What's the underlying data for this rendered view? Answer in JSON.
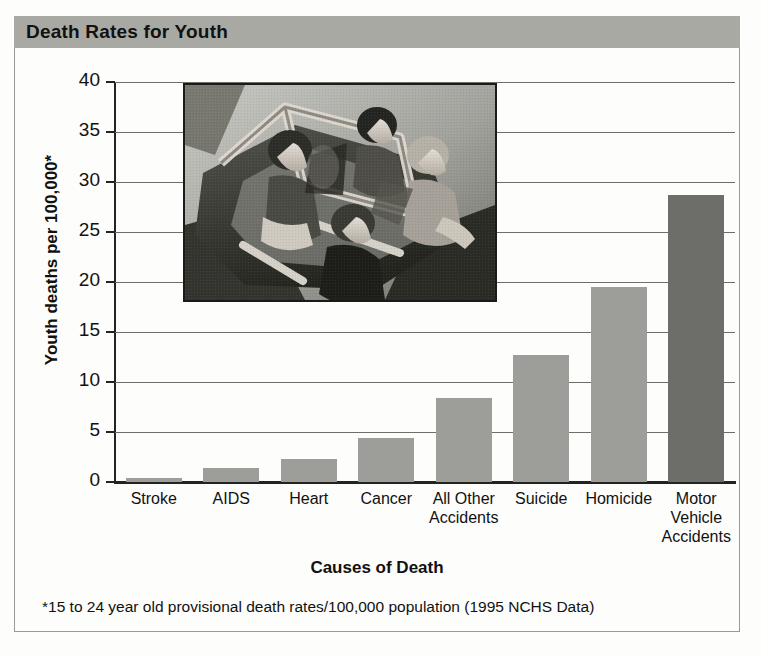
{
  "title": "Death Rates for Youth",
  "footnote": "*15 to 24 year old provisional death rates/100,000 population (1995 NCHS Data)",
  "colors": {
    "title_band": "#a9a9a4",
    "bar_default": "#9d9d99",
    "bar_highlight": "#6d6d69",
    "axis": "#23231f",
    "gridline": "#6f6f6a",
    "background": "#fdfdfb"
  },
  "photo": {
    "alt": "Black and white overhead photograph of four young people riding in an open convertible car",
    "name": "teens-in-convertible-photo"
  },
  "chart_data": {
    "type": "bar",
    "title": "Death Rates for Youth",
    "xlabel": "Causes of Death",
    "ylabel": "Youth deaths per 100,000*",
    "ylim": [
      0,
      40
    ],
    "yticks": [
      0,
      5,
      10,
      15,
      20,
      25,
      30,
      35,
      40
    ],
    "ytick_labels": [
      "0",
      "5",
      "10",
      "15",
      "20",
      "25",
      "30",
      "35",
      "40"
    ],
    "grid": true,
    "legend": "none",
    "categories": [
      "Stroke",
      "AIDS",
      "Heart",
      "Cancer",
      "All Other Accidents",
      "Suicide",
      "Homicide",
      "Motor Vehicle Accidents"
    ],
    "category_lines": [
      [
        "Stroke"
      ],
      [
        "AIDS"
      ],
      [
        "Heart"
      ],
      [
        "Cancer"
      ],
      [
        "All Other",
        "Accidents"
      ],
      [
        "Suicide"
      ],
      [
        "Homicide"
      ],
      [
        "Motor",
        "Vehicle",
        "Accidents"
      ]
    ],
    "values": [
      0.4,
      1.4,
      2.3,
      4.4,
      8.4,
      12.7,
      19.5,
      28.7
    ],
    "highlight_index": 7,
    "annotation": "*15 to 24 year old provisional death rates/100,000 population (1995 NCHS Data)"
  }
}
